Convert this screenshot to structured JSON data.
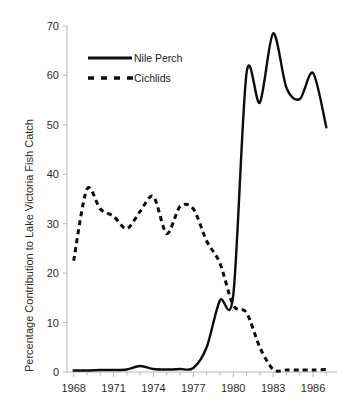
{
  "chart_data": {
    "type": "line",
    "title": "",
    "xlabel": "",
    "ylabel": "Percentage Contribution to Lake Victoria Fish Catch",
    "xlim": [
      1967.5,
      1987.8
    ],
    "ylim": [
      0,
      70
    ],
    "grid": false,
    "legend_position": "top-left-inside",
    "x_tick_labels": [
      "1968",
      "1971",
      "1974",
      "1977",
      "1980",
      "1983",
      "1986"
    ],
    "x_tick_values": [
      1968,
      1971,
      1974,
      1977,
      1980,
      1983,
      1986
    ],
    "x_minor_ticks": [
      1969,
      1970,
      1972,
      1973,
      1975,
      1976,
      1978,
      1979,
      1981,
      1982,
      1984,
      1985,
      1987
    ],
    "y_tick_labels": [
      "0",
      "10",
      "20",
      "30",
      "40",
      "50",
      "60",
      "70"
    ],
    "y_tick_values": [
      0,
      10,
      20,
      30,
      40,
      50,
      60,
      70
    ],
    "x": [
      1968,
      1969,
      1970,
      1971,
      1972,
      1973,
      1974,
      1975,
      1976,
      1977,
      1978,
      1979,
      1980,
      1981,
      1982,
      1983,
      1984,
      1985,
      1986,
      1987
    ],
    "series": [
      {
        "name": "Nile Perch",
        "style": "solid",
        "color": "#0d0d0d",
        "values": [
          0.3,
          0.3,
          0.4,
          0.4,
          0.5,
          1.2,
          0.6,
          0.5,
          0.6,
          0.8,
          5.0,
          14.5,
          15.5,
          60.5,
          54.5,
          68.5,
          57.5,
          55.2,
          60.5,
          49.5
        ]
      },
      {
        "name": "Cichlids",
        "style": "dashed",
        "color": "#0d0d0d",
        "values": [
          22.5,
          37.0,
          33.0,
          31.5,
          29.0,
          32.5,
          35.5,
          28.0,
          33.5,
          33.0,
          26.5,
          22.0,
          13.5,
          12.0,
          5.0,
          0.5,
          0.4,
          0.4,
          0.4,
          0.5
        ]
      }
    ],
    "annotations": []
  },
  "legend": {
    "items": [
      {
        "label": "Nile Perch",
        "style": "solid"
      },
      {
        "label": "Cichlids",
        "style": "dashed"
      }
    ]
  },
  "axes": {
    "y_title": "Percentage Contribution to Lake Victoria Fish Catch"
  }
}
